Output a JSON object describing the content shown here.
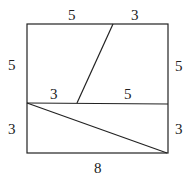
{
  "diagram": {
    "type": "geometry-square-dissection",
    "labels": {
      "top_left": "5",
      "top_right": "3",
      "left_upper": "5",
      "right_upper": "5",
      "mid_left": "3",
      "mid_right": "5",
      "left_lower": "3",
      "right_lower": "3",
      "bottom": "8"
    }
  }
}
